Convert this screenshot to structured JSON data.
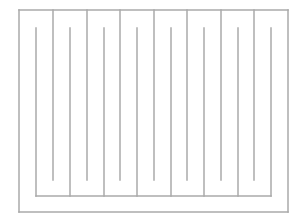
{
  "diagram": {
    "type": "serpentine-maze",
    "width": 303,
    "height": 222,
    "stroke_color": "#aaaaaa",
    "stroke_width": 1.5,
    "outer_frame": {
      "left": 19,
      "top": 10,
      "right": 288,
      "bottom": 212
    },
    "top_hanging_lines": {
      "x": [
        53,
        87,
        120,
        154,
        187,
        221,
        254
      ],
      "y_start": 10,
      "y_end": 180
    },
    "inner_comb": {
      "x": [
        36,
        70,
        104,
        137,
        171,
        204,
        238,
        271
      ],
      "y_start": 28,
      "y_bottom": 196
    }
  }
}
